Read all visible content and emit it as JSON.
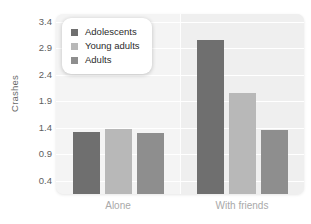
{
  "chart_data": {
    "type": "bar",
    "title": "",
    "subtitle": "",
    "xlabel": "",
    "ylabel": "Crashes",
    "categories": [
      "Alone",
      "With friends"
    ],
    "series": [
      {
        "name": "Adolescents",
        "color": "#6f6f6f",
        "values": [
          1.32,
          3.05
        ]
      },
      {
        "name": "Young adults",
        "color": "#b8b8b8",
        "values": [
          1.38,
          2.05
        ]
      },
      {
        "name": "Adults",
        "color": "#8e8e8e",
        "values": [
          1.3,
          1.35
        ]
      }
    ],
    "yticks": [
      0.4,
      0.9,
      1.4,
      1.9,
      2.4,
      2.9,
      3.4
    ],
    "ytick_labels": [
      "0.4",
      "0.9",
      "1.4",
      "1.9",
      "2.4",
      "2.9",
      "3.4"
    ],
    "ylim": [
      0.15,
      3.55
    ],
    "grid": true,
    "grid_axis": "y",
    "legend_position": "top-left",
    "panel_background": "#f4f4f4",
    "band_background": "#efefef",
    "gridline_color": "#ffffff",
    "figure_background": "#ffffff",
    "tick_label_color": "#5e5e5e",
    "xtick_label_color": "#a9a9a9"
  },
  "legend": {
    "items": [
      {
        "label": "Adolescents",
        "swatch": "legend-swatch-adolescents"
      },
      {
        "label": "Young adults",
        "swatch": "legend-swatch-young-adults"
      },
      {
        "label": "Adults",
        "swatch": "legend-swatch-adults"
      }
    ]
  }
}
